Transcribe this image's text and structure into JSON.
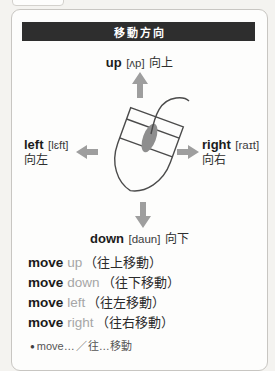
{
  "header": {
    "title": "移動方向"
  },
  "diagram": {
    "up": {
      "word": "up",
      "phonetic": "[ʌp]",
      "chinese": "向上"
    },
    "left": {
      "word": "left",
      "phonetic": "[lɛft]",
      "chinese": "向左"
    },
    "right": {
      "word": "right",
      "phonetic": "[raɪt]",
      "chinese": "向右"
    },
    "down": {
      "word": "down",
      "phonetic": "[daun]",
      "chinese": "向下"
    }
  },
  "phrases": [
    {
      "verb": "move",
      "direction": "up",
      "chinese": "（往上移動）"
    },
    {
      "verb": "move",
      "direction": "down",
      "chinese": "（往下移動）"
    },
    {
      "verb": "move",
      "direction": "left",
      "chinese": "（往左移動）"
    },
    {
      "verb": "move",
      "direction": "right",
      "chinese": "（往右移動）"
    }
  ],
  "pattern": {
    "bullet": "●",
    "text": "move…",
    "separator": "／",
    "chinese": "往…移動"
  },
  "colors": {
    "header_bg": "#2e2e2e",
    "arrow_gray": "#9e9e9e",
    "muted_gray": "#a6a6a6",
    "line": "#4b4b4b"
  }
}
